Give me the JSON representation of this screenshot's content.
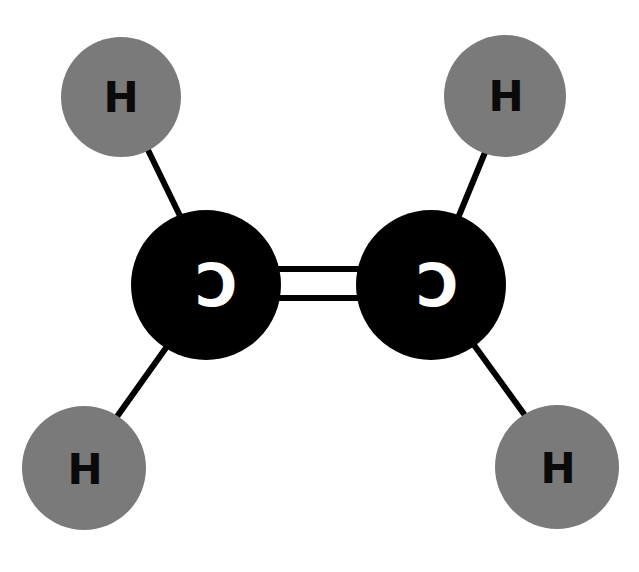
{
  "diagram": {
    "type": "molecule",
    "colors": {
      "background": "#ffffff",
      "hydrogen_fill": "#7a7a7a",
      "hydrogen_label": "#0a0a0a",
      "carbon_fill": "#000000",
      "carbon_label": "#ffffff",
      "bond": "#000000"
    },
    "atoms": [
      {
        "id": "H1",
        "element": "H",
        "label": "H"
      },
      {
        "id": "H2",
        "element": "H",
        "label": "H"
      },
      {
        "id": "H3",
        "element": "H",
        "label": "H"
      },
      {
        "id": "H4",
        "element": "H",
        "label": "H"
      },
      {
        "id": "C1",
        "element": "C",
        "label": "C"
      },
      {
        "id": "C2",
        "element": "C",
        "label": "C"
      }
    ],
    "bonds": [
      {
        "from": "C1",
        "to": "C2",
        "order": 2
      },
      {
        "from": "C1",
        "to": "H1",
        "order": 1
      },
      {
        "from": "C1",
        "to": "H3",
        "order": 1
      },
      {
        "from": "C2",
        "to": "H2",
        "order": 1
      },
      {
        "from": "C2",
        "to": "H4",
        "order": 1
      }
    ]
  }
}
